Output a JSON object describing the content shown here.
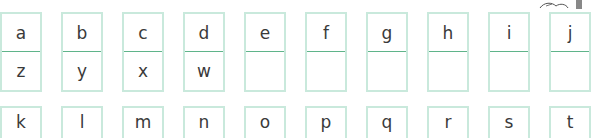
{
  "worksheet": {
    "row1": {
      "top_letters": [
        "a",
        "b",
        "c",
        "d",
        "e",
        "f",
        "g",
        "h",
        "i",
        "j"
      ],
      "bottom_letters": [
        "z",
        "y",
        "x",
        "w",
        "",
        "",
        "",
        "",
        "",
        ""
      ]
    },
    "row2": {
      "top_letters": [
        "k",
        "l",
        "m",
        "n",
        "o",
        "p",
        "q",
        "r",
        "s",
        "t"
      ]
    },
    "colors": {
      "box_border": "#c9e9dc",
      "divider": "#5fb48a",
      "text": "#3a3a3a"
    }
  }
}
